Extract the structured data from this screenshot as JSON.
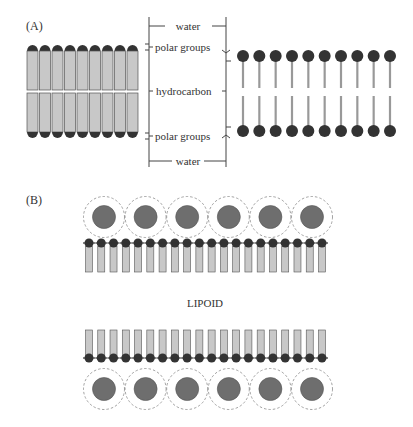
{
  "panel_a": {
    "label": "(A)",
    "rod_count": 9,
    "lollipop_count": 10,
    "layer_labels": {
      "water_top": "water",
      "polar_top": "polar groups",
      "hydrocarbon": "hydrocarbon",
      "polar_bottom": "polar groups",
      "water_bottom": "water"
    }
  },
  "panel_b": {
    "label": "(B)",
    "center_label": "LIPOID",
    "particle_count_top": 6,
    "particle_count_bottom": 6,
    "lipid_count_top": 20,
    "lipid_count_bottom": 20
  },
  "colors": {
    "rod_fill": "#c8c8c8",
    "rod_stroke": "#555555",
    "head_fill": "#333333",
    "particle_fill": "#6e6e6e",
    "halo_stroke": "#8a8a8a",
    "line": "#444444"
  }
}
